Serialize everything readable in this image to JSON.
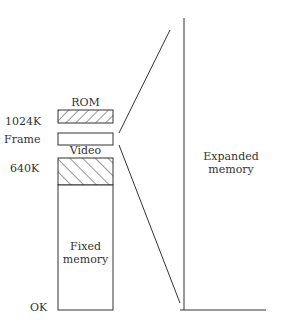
{
  "diagram": {
    "axis_labels": {
      "k1024": "1024K",
      "frame": "Frame",
      "k640": "640K",
      "ok": "OK"
    },
    "blocks": {
      "rom": "ROM",
      "video": "Video",
      "fixed_line1": "Fixed",
      "fixed_line2": "memory"
    },
    "expanded": {
      "line1": "Expanded",
      "line2": "memory"
    },
    "colors": {
      "ink": "#333333",
      "background": "#ffffff"
    }
  }
}
